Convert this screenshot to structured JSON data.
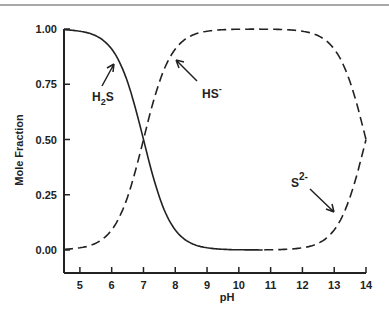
{
  "chart_data": {
    "type": "line",
    "title": "",
    "xlabel": "pH",
    "ylabel": "Mole Fraction",
    "xlim": [
      4.5,
      14
    ],
    "ylim": [
      0,
      1
    ],
    "x_ticks": [
      5,
      6,
      7,
      8,
      9,
      10,
      11,
      12,
      13,
      14
    ],
    "x_tick_labels": [
      "5",
      "6",
      "7",
      "8",
      "9",
      "10",
      "11",
      "12",
      "13",
      "14"
    ],
    "y_ticks": [
      0,
      0.25,
      0.5,
      0.75,
      1.0
    ],
    "y_tick_labels": [
      "0.00",
      "0.25",
      "0.50",
      "0.75",
      "1.00"
    ],
    "grid": false,
    "legend": "none (curves labeled with arrows)",
    "pKa1": 7.0,
    "pKa2": 14.0,
    "x": [
      4.5,
      5,
      5.5,
      6,
      6.5,
      7,
      7.5,
      8,
      8.5,
      9,
      10,
      11,
      12,
      12.5,
      13,
      13.5,
      14
    ],
    "series": [
      {
        "name": "H2S",
        "style": "solid",
        "values": [
          1.0,
          0.99,
          0.97,
          0.91,
          0.76,
          0.5,
          0.24,
          0.09,
          0.03,
          0.01,
          0.0,
          0.0,
          0.0,
          0.0,
          0.0,
          0.0,
          0.0
        ]
      },
      {
        "name": "HS-",
        "style": "dashed",
        "values": [
          0.0,
          0.01,
          0.03,
          0.09,
          0.24,
          0.5,
          0.76,
          0.91,
          0.97,
          0.99,
          1.0,
          0.99,
          0.99,
          0.97,
          0.91,
          0.76,
          0.5
        ]
      },
      {
        "name": "S2-",
        "style": "dashed",
        "values": [
          0.0,
          0.0,
          0.0,
          0.0,
          0.0,
          0.0,
          0.0,
          0.0,
          0.0,
          0.0,
          0.0,
          0.0,
          0.01,
          0.03,
          0.09,
          0.24,
          0.5
        ]
      }
    ],
    "annotations": [
      {
        "text": "H2S",
        "base": "H",
        "sub": "2",
        "tail": "S",
        "arrow_to_x": 6.2,
        "arrow_to_y": 0.88
      },
      {
        "text": "HS-",
        "base": "HS",
        "sup": "-",
        "arrow_to_x": 7.9,
        "arrow_to_y": 0.88
      },
      {
        "text": "S2-",
        "base": "S",
        "sup": "2-",
        "arrow_to_x": 13.0,
        "arrow_to_y": 0.14
      }
    ]
  },
  "colors": {
    "line": "#222222",
    "top_rule": "#a8a8a8",
    "background": "#ffffff"
  }
}
